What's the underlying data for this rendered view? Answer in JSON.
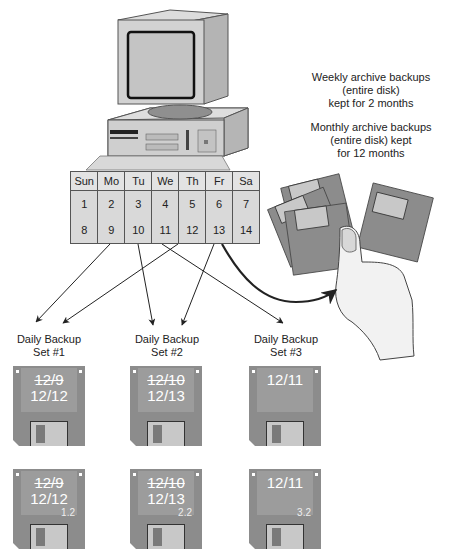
{
  "diagram": {
    "calendar": {
      "headers": [
        "Sun",
        "Mo",
        "Tu",
        "We",
        "Th",
        "Fr",
        "Sa"
      ],
      "weeks": [
        [
          "1",
          "2",
          "3",
          "4",
          "5",
          "6",
          "7"
        ],
        [
          "8",
          "9",
          "10",
          "11",
          "12",
          "13",
          "14"
        ]
      ]
    },
    "notes": {
      "weekly": [
        "Weekly archive backups",
        "(entire disk)",
        "kept for 2 months"
      ],
      "monthly": [
        "Monthly archive backups",
        "(entire disk) kept",
        "for 12 months"
      ]
    },
    "sets": [
      {
        "title": [
          "Daily Backup",
          "Set #1"
        ],
        "old_date": "12/9",
        "new_date": "12/12",
        "disk_numbers": [
          "",
          "1.2"
        ]
      },
      {
        "title": [
          "Daily Backup",
          "Set #2"
        ],
        "old_date": "12/10",
        "new_date": "12/13",
        "disk_numbers": [
          "",
          "2.2"
        ]
      },
      {
        "title": [
          "Daily Backup",
          "Set #3"
        ],
        "old_date": "",
        "new_date": "12/11",
        "disk_numbers": [
          "",
          "3.2"
        ]
      }
    ],
    "arrows": [
      {
        "from": "9",
        "to": "Set #1"
      },
      {
        "from": "12",
        "to": "Set #1"
      },
      {
        "from": "10",
        "to": "Set #2"
      },
      {
        "from": "13",
        "to": "Set #2"
      },
      {
        "from": "11",
        "to": "Set #3"
      },
      {
        "from": "13",
        "to": "archive (hand with disks)"
      }
    ],
    "colors": {
      "disk": "#8c8c8c",
      "label": "#9c9c9c",
      "shutter": "#c8c8c8",
      "calendar": "#d9d9d9",
      "arrow": "#222222"
    }
  }
}
